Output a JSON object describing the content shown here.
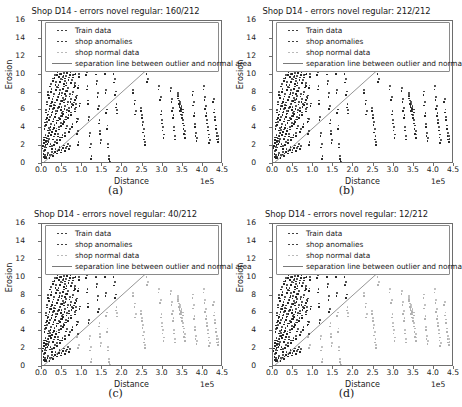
{
  "figure": {
    "panels": [
      {
        "id": "a",
        "caption": "(a)",
        "title": "Shop D14 - errors novel regular: 160/212",
        "errors": 160,
        "total": 212,
        "shop_series_role": "anomalies"
      },
      {
        "id": "b",
        "caption": "(b)",
        "title": "Shop D14 - errors novel regular: 212/212",
        "errors": 212,
        "total": 212,
        "shop_series_role": "anomalies"
      },
      {
        "id": "c",
        "caption": "(c)",
        "title": "Shop D14 - errors novel regular: 40/212",
        "errors": 40,
        "total": 212,
        "shop_series_role": "normal"
      },
      {
        "id": "d",
        "caption": "(d)",
        "title": "Shop D14 - errors novel regular: 12/212",
        "errors": 12,
        "total": 212,
        "shop_series_role": "normal"
      }
    ]
  },
  "legend": {
    "entries": [
      {
        "label": "Train data",
        "marker": "dots",
        "color": "#262626"
      },
      {
        "label": "shop anomalies",
        "marker": "dots",
        "color": "#262626"
      },
      {
        "label": "shop normal data",
        "marker": "dots",
        "color": "#b0b0b0"
      },
      {
        "label": "separation line between outlier and normal area",
        "marker": "line",
        "color": "#7a7a7a"
      }
    ]
  },
  "chart_data": {
    "type": "scatter",
    "title": "Shop D14 - errors novel regular",
    "xlabel": "Distance",
    "ylabel": "Erosion",
    "x_exponent": "1e5",
    "xlim": [
      0,
      450000
    ],
    "ylim": [
      0,
      16
    ],
    "xticks": [
      0.0,
      0.5,
      1.0,
      1.5,
      2.0,
      2.5,
      3.0,
      3.5,
      4.0,
      4.5
    ],
    "xtick_labels": [
      "0.0",
      "0.5",
      "1.0",
      "1.5",
      "2.0",
      "2.5",
      "3.0",
      "3.5",
      "4.0",
      "4.5"
    ],
    "yticks": [
      0,
      2,
      4,
      6,
      8,
      10,
      12,
      14,
      16
    ],
    "ytick_labels": [
      "0",
      "2",
      "4",
      "6",
      "8",
      "10",
      "12",
      "14",
      "16"
    ],
    "grid": false,
    "legend_position": "upper left",
    "separation_line": {
      "label": "separation line between outlier and normal area",
      "x": [
        0,
        262000
      ],
      "y": [
        0,
        10.6
      ],
      "slope_per_unit_x": 4.046e-05,
      "color": "#7a7a7a"
    },
    "series": [
      {
        "name": "Train data",
        "color": "#262626",
        "marker": "point",
        "comment": "dense low-distance cluster, x<1.0e5, spanning erosion 0.8-10.6",
        "points": [
          [
            4000,
            2.2
          ],
          [
            5200,
            2.5
          ],
          [
            6100,
            1.6
          ],
          [
            7000,
            3.1
          ],
          [
            7600,
            2.8
          ],
          [
            8200,
            1.2
          ],
          [
            8800,
            4.4
          ],
          [
            9400,
            2.0
          ],
          [
            10100,
            3.4
          ],
          [
            10600,
            5.1
          ],
          [
            11200,
            2.6
          ],
          [
            11800,
            6.2
          ],
          [
            12400,
            3.0
          ],
          [
            13000,
            4.8
          ],
          [
            13600,
            2.3
          ],
          [
            14200,
            7.1
          ],
          [
            14900,
            5.6
          ],
          [
            15400,
            3.3
          ],
          [
            16000,
            2.7
          ],
          [
            16700,
            8.2
          ],
          [
            17300,
            6.0
          ],
          [
            17900,
            4.2
          ],
          [
            18500,
            2.9
          ],
          [
            19100,
            3.6
          ],
          [
            19800,
            7.8
          ],
          [
            20400,
            5.4
          ],
          [
            21000,
            6.6
          ],
          [
            21600,
            3.9
          ],
          [
            22300,
            2.4
          ],
          [
            22900,
            9.1
          ],
          [
            23500,
            4.6
          ],
          [
            24100,
            6.9
          ],
          [
            24800,
            8.5
          ],
          [
            25400,
            3.7
          ],
          [
            26000,
            5.9
          ],
          [
            26600,
            2.1
          ],
          [
            27300,
            7.4
          ],
          [
            27900,
            4.0
          ],
          [
            28500,
            6.3
          ],
          [
            29100,
            9.7
          ],
          [
            29800,
            5.2
          ],
          [
            30400,
            3.2
          ],
          [
            31000,
            8.0
          ],
          [
            31600,
            6.7
          ],
          [
            32300,
            4.5
          ],
          [
            32900,
            2.6
          ],
          [
            33500,
            10.1
          ],
          [
            34100,
            7.0
          ],
          [
            34800,
            5.7
          ],
          [
            35400,
            3.8
          ],
          [
            36000,
            9.3
          ],
          [
            36600,
            6.1
          ],
          [
            37300,
            4.1
          ],
          [
            37900,
            8.7
          ],
          [
            38500,
            5.0
          ],
          [
            39100,
            2.8
          ],
          [
            39800,
            10.4
          ],
          [
            40400,
            7.6
          ],
          [
            41000,
            6.4
          ],
          [
            41600,
            3.5
          ],
          [
            42300,
            9.0
          ],
          [
            42900,
            5.3
          ],
          [
            43500,
            7.9
          ],
          [
            44100,
            4.3
          ],
          [
            44800,
            10.2
          ],
          [
            45400,
            6.8
          ],
          [
            46000,
            8.4
          ],
          [
            46600,
            3.1
          ],
          [
            47300,
            5.5
          ],
          [
            47900,
            9.6
          ],
          [
            48500,
            7.2
          ],
          [
            49100,
            4.7
          ],
          [
            49800,
            6.5
          ],
          [
            50400,
            10.5
          ],
          [
            51000,
            8.1
          ],
          [
            51600,
            5.8
          ],
          [
            52300,
            3.4
          ],
          [
            52900,
            7.5
          ],
          [
            53500,
            9.9
          ],
          [
            54100,
            6.0
          ],
          [
            54800,
            4.9
          ],
          [
            55400,
            8.8
          ],
          [
            56000,
            10.3
          ],
          [
            56600,
            7.3
          ],
          [
            57300,
            5.1
          ],
          [
            57900,
            9.4
          ],
          [
            58500,
            6.6
          ],
          [
            59100,
            3.6
          ],
          [
            59800,
            8.3
          ],
          [
            60400,
            10.0
          ],
          [
            61000,
            7.7
          ],
          [
            61600,
            5.4
          ],
          [
            62300,
            9.2
          ],
          [
            62900,
            4.4
          ],
          [
            63500,
            6.2
          ],
          [
            64100,
            10.6
          ],
          [
            65000,
            8.6
          ],
          [
            66000,
            7.1
          ],
          [
            67000,
            5.6
          ],
          [
            68000,
            9.8
          ],
          [
            69000,
            6.4
          ],
          [
            70000,
            4.0
          ],
          [
            71000,
            8.0
          ],
          [
            72000,
            10.4
          ],
          [
            73000,
            7.4
          ],
          [
            74000,
            5.9
          ],
          [
            75000,
            9.5
          ],
          [
            76000,
            6.8
          ],
          [
            77000,
            4.6
          ],
          [
            78000,
            8.2
          ],
          [
            79000,
            10.1
          ],
          [
            80000,
            7.0
          ],
          [
            82000,
            9.0
          ],
          [
            84000,
            6.3
          ],
          [
            86000,
            10.5
          ],
          [
            88000,
            7.8
          ],
          [
            90000,
            5.2
          ],
          [
            92000,
            8.9
          ],
          [
            94000,
            10.2
          ],
          [
            96000,
            6.9
          ],
          [
            9000,
            1.0
          ],
          [
            12000,
            0.9
          ],
          [
            16000,
            1.4
          ],
          [
            21000,
            1.1
          ],
          [
            26000,
            1.5
          ],
          [
            30000,
            1.3
          ],
          [
            35000,
            1.8
          ],
          [
            40000,
            1.6
          ],
          [
            45000,
            2.0
          ],
          [
            50000,
            1.7
          ],
          [
            55000,
            2.2
          ],
          [
            60000,
            1.9
          ],
          [
            65000,
            2.4
          ],
          [
            70000,
            2.1
          ]
        ]
      },
      {
        "name": "shop data",
        "color_anomalies": "#262626",
        "color_normal": "#b0b0b0",
        "marker": "point",
        "comment": "spread across full distance range; rendered dark in (a)/(b), light gray right of separation line in (c)/(d)",
        "points": [
          [
            82000,
            10.5
          ],
          [
            84000,
            9.2
          ],
          [
            85000,
            7.6
          ],
          [
            86000,
            6.8
          ],
          [
            88000,
            5.2
          ],
          [
            90000,
            3.8
          ],
          [
            92000,
            2.6
          ],
          [
            112000,
            10.4
          ],
          [
            114000,
            8.8
          ],
          [
            116000,
            7.2
          ],
          [
            118000,
            5.4
          ],
          [
            120000,
            3.6
          ],
          [
            122000,
            2.3
          ],
          [
            124000,
            1.0
          ],
          [
            136000,
            10.5
          ],
          [
            138000,
            9.4
          ],
          [
            140000,
            8.0
          ],
          [
            142000,
            6.6
          ],
          [
            144000,
            5.0
          ],
          [
            146000,
            3.8
          ],
          [
            148000,
            2.8
          ],
          [
            158000,
            10.5
          ],
          [
            160000,
            8.4
          ],
          [
            162000,
            6.2
          ],
          [
            164000,
            4.4
          ],
          [
            166000,
            2.3
          ],
          [
            168000,
            1.0
          ],
          [
            170000,
            0.3
          ],
          [
            180000,
            10.5
          ],
          [
            182000,
            9.6
          ],
          [
            184000,
            8.2
          ],
          [
            186000,
            6.8
          ],
          [
            188000,
            6.1
          ],
          [
            228000,
            8.4
          ],
          [
            232000,
            7.2
          ],
          [
            234000,
            6.0
          ],
          [
            248000,
            6.4
          ],
          [
            250000,
            5.6
          ],
          [
            252000,
            4.8
          ],
          [
            254000,
            4.0
          ],
          [
            256000,
            3.2
          ],
          [
            258000,
            2.6
          ],
          [
            262000,
            10.5
          ],
          [
            264000,
            9.6
          ],
          [
            292000,
            8.8
          ],
          [
            296000,
            7.6
          ],
          [
            298000,
            6.0
          ],
          [
            300000,
            5.0
          ],
          [
            302000,
            4.2
          ],
          [
            304000,
            3.4
          ],
          [
            322000,
            8.6
          ],
          [
            324000,
            7.4
          ],
          [
            326000,
            6.4
          ],
          [
            328000,
            5.6
          ],
          [
            330000,
            4.2
          ],
          [
            332000,
            3.2
          ],
          [
            340000,
            8.0
          ],
          [
            342000,
            7.2
          ],
          [
            344000,
            6.8
          ],
          [
            346000,
            6.4
          ],
          [
            348000,
            6.0
          ],
          [
            350000,
            5.6
          ],
          [
            352000,
            5.0
          ],
          [
            354000,
            4.4
          ],
          [
            356000,
            3.8
          ],
          [
            358000,
            3.4
          ],
          [
            340000,
            7.8
          ],
          [
            344000,
            7.0
          ],
          [
            348000,
            6.6
          ],
          [
            352000,
            6.2
          ],
          [
            376000,
            8.2
          ],
          [
            378000,
            7.0
          ],
          [
            380000,
            5.8
          ],
          [
            382000,
            4.6
          ],
          [
            384000,
            3.6
          ],
          [
            386000,
            3.0
          ],
          [
            404000,
            8.8
          ],
          [
            406000,
            7.6
          ],
          [
            408000,
            6.6
          ],
          [
            410000,
            5.8
          ],
          [
            412000,
            5.0
          ],
          [
            414000,
            4.2
          ],
          [
            416000,
            3.4
          ],
          [
            418000,
            2.8
          ],
          [
            428000,
            7.4
          ],
          [
            430000,
            6.2
          ],
          [
            432000,
            5.4
          ],
          [
            434000,
            4.4
          ],
          [
            436000,
            3.6
          ],
          [
            438000,
            3.2
          ],
          [
            440000,
            2.9
          ]
        ]
      }
    ]
  }
}
